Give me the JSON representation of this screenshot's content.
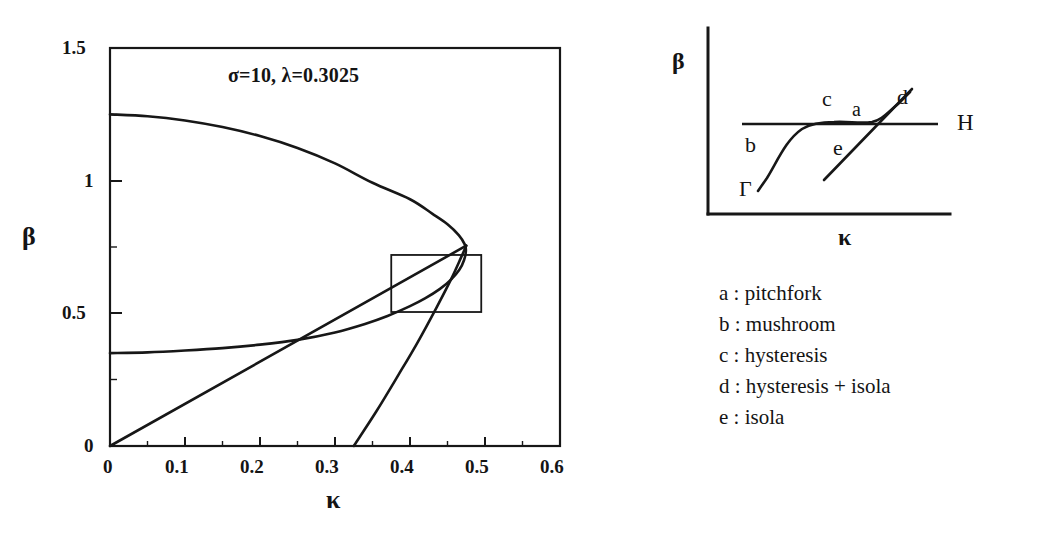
{
  "figure": {
    "left_plot": {
      "annotation": "σ=10, λ=0.3025",
      "xlabel": "κ",
      "ylabel": "β",
      "xticks": [
        "0",
        "0.1",
        "0.2",
        "0.3",
        "0.4",
        "0.5",
        "0.6"
      ],
      "yticks": [
        "0",
        "0.5",
        "1",
        "1.5"
      ]
    },
    "schematic": {
      "xlabel": "κ",
      "ylabel": "β",
      "curve_label_H": "H",
      "curve_label_gamma": "Γ",
      "region_labels": [
        "a",
        "b",
        "c",
        "d",
        "e"
      ]
    },
    "legend": {
      "items": [
        "a : pitchfork",
        "b : mushroom",
        "c : hysteresis",
        "d : hysteresis + isola",
        "e : isola"
      ]
    }
  },
  "chart_data": {
    "type": "line",
    "title": "",
    "annotation": "σ=10, λ=0.3025",
    "xlabel": "κ",
    "ylabel": "β",
    "xlim": [
      0,
      0.6
    ],
    "ylim": [
      0,
      1.5
    ],
    "xticks": [
      0,
      0.1,
      0.2,
      0.3,
      0.4,
      0.5,
      0.6
    ],
    "yticks": [
      0,
      0.5,
      1,
      1.5
    ],
    "minor_ticks": true,
    "grid": false,
    "legend": "none",
    "series": [
      {
        "name": "upper-fold-branch",
        "comment": "upper branch of the cusp curve, from beta=1.25 at kappa=0 folding back at kappa~0.475",
        "points": [
          [
            0.0,
            1.25
          ],
          [
            0.05,
            1.243
          ],
          [
            0.1,
            1.227
          ],
          [
            0.15,
            1.202
          ],
          [
            0.2,
            1.168
          ],
          [
            0.25,
            1.123
          ],
          [
            0.3,
            1.065
          ],
          [
            0.35,
            0.992
          ],
          [
            0.4,
            0.93
          ],
          [
            0.43,
            0.875
          ],
          [
            0.45,
            0.836
          ],
          [
            0.465,
            0.795
          ],
          [
            0.473,
            0.76
          ],
          [
            0.4745,
            0.735
          ],
          [
            0.472,
            0.7
          ],
          [
            0.466,
            0.665
          ],
          [
            0.455,
            0.628
          ],
          [
            0.44,
            0.592
          ],
          [
            0.42,
            0.556
          ],
          [
            0.4,
            0.527
          ],
          [
            0.37,
            0.49
          ],
          [
            0.34,
            0.46
          ],
          [
            0.3,
            0.428
          ],
          [
            0.25,
            0.4
          ],
          [
            0.2,
            0.382
          ],
          [
            0.15,
            0.369
          ],
          [
            0.1,
            0.36
          ],
          [
            0.05,
            0.353
          ],
          [
            0.0,
            0.35
          ]
        ]
      },
      {
        "name": "lower-straight-branch",
        "comment": "straight line rising from the origin to the fold point",
        "points": [
          [
            0.0,
            0.0
          ],
          [
            0.475,
            0.755
          ]
        ]
      },
      {
        "name": "steep-branch",
        "comment": "steep curve meeting the axis at kappa~0.325 and rising to the fold point",
        "points": [
          [
            0.325,
            0.0
          ],
          [
            0.355,
            0.13
          ],
          [
            0.385,
            0.27
          ],
          [
            0.41,
            0.39
          ],
          [
            0.435,
            0.52
          ],
          [
            0.455,
            0.63
          ],
          [
            0.468,
            0.71
          ],
          [
            0.475,
            0.755
          ]
        ]
      }
    ],
    "inset_box": {
      "x0": 0.375,
      "x1": 0.495,
      "y0": 0.505,
      "y1": 0.72
    },
    "fold_point": [
      0.475,
      0.755
    ]
  }
}
